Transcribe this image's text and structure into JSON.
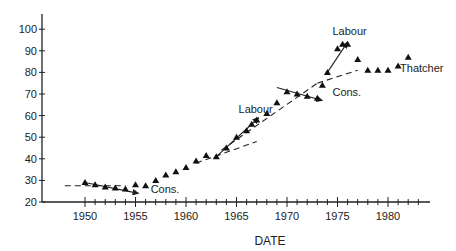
{
  "chart_data": {
    "type": "scatter",
    "title": "",
    "xlabel": "DATE",
    "ylabel": "",
    "xlim": [
      1947,
      1984
    ],
    "ylim": [
      20,
      105
    ],
    "x_ticks": [
      1950,
      1955,
      1960,
      1965,
      1970,
      1975,
      1980
    ],
    "y_ticks": [
      20,
      30,
      40,
      50,
      60,
      70,
      80,
      90,
      100
    ],
    "grid": false,
    "legend": null,
    "series": [
      {
        "name": "observations",
        "marker": "triangle",
        "points": [
          [
            1950,
            29
          ],
          [
            1951,
            28
          ],
          [
            1952,
            27
          ],
          [
            1953,
            26.5
          ],
          [
            1954,
            26
          ],
          [
            1955,
            28
          ],
          [
            1956,
            27.5
          ],
          [
            1957,
            30
          ],
          [
            1958,
            32.5
          ],
          [
            1959,
            34
          ],
          [
            1960,
            36
          ],
          [
            1961,
            39
          ],
          [
            1962,
            41.5
          ],
          [
            1963,
            41
          ],
          [
            1964,
            45
          ],
          [
            1965,
            50
          ],
          [
            1966,
            53
          ],
          [
            1966.5,
            56
          ],
          [
            1967,
            58
          ],
          [
            1968,
            61
          ],
          [
            1969,
            66
          ],
          [
            1970,
            71
          ],
          [
            1971,
            70
          ],
          [
            1972,
            69
          ],
          [
            1973,
            68
          ],
          [
            1973.5,
            74
          ],
          [
            1974,
            80
          ],
          [
            1975,
            91
          ],
          [
            1975.5,
            93
          ],
          [
            1976,
            93
          ],
          [
            1977,
            86
          ],
          [
            1978,
            81
          ],
          [
            1979,
            81
          ],
          [
            1980,
            81
          ],
          [
            1981,
            83
          ],
          [
            1982,
            87
          ]
        ]
      }
    ],
    "trend_lines": [
      {
        "style": "dashed",
        "from": [
          1948,
          27.5
        ],
        "to": [
          1954,
          27.5
        ]
      },
      {
        "style": "solid-arrow",
        "from": [
          1950,
          29
        ],
        "to": [
          1955.3,
          24
        ],
        "label": "Cons."
      },
      {
        "style": "dashed",
        "from": [
          1961,
          38
        ],
        "to": [
          1967,
          48
        ]
      },
      {
        "style": "solid-arrow",
        "from": [
          1963,
          41
        ],
        "to": [
          1967.2,
          59
        ],
        "label": "Labour"
      },
      {
        "style": "dashed",
        "from": [
          1963.5,
          44
        ],
        "to": [
          1973,
          75
        ]
      },
      {
        "style": "solid-arrow",
        "from": [
          1969,
          73
        ],
        "to": [
          1973.5,
          67
        ],
        "label": "Cons."
      },
      {
        "style": "dashed",
        "from": [
          1973,
          75
        ],
        "to": [
          1977,
          81
        ]
      },
      {
        "style": "solid-arrow",
        "from": [
          1974,
          80
        ],
        "to": [
          1976,
          94
        ],
        "label": "Labour"
      }
    ],
    "annotations": [
      {
        "text": "Cons.",
        "x": 1956.5,
        "y": 24
      },
      {
        "text": "Labour",
        "x": 1965.2,
        "y": 61
      },
      {
        "text": "Cons.",
        "x": 1974.5,
        "y": 69
      },
      {
        "text": "Labour",
        "x": 1974.5,
        "y": 97.5
      },
      {
        "text": "Thatcher",
        "x": 1981.2,
        "y": 80
      }
    ]
  },
  "labels": {
    "xlabel": "DATE",
    "annotations": [
      "Cons.",
      "Labour",
      "Cons.",
      "Labour",
      "Thatcher"
    ]
  }
}
